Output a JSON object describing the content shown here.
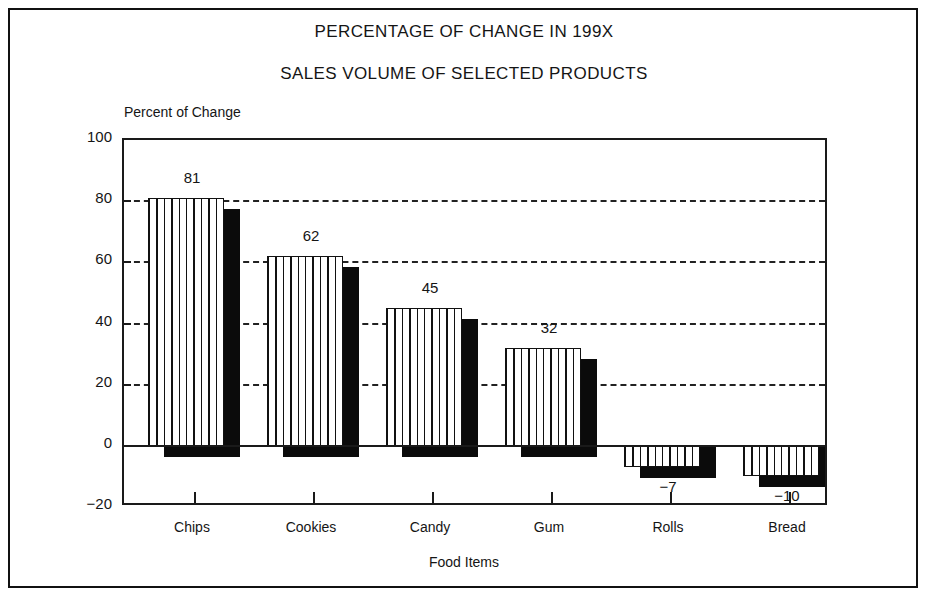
{
  "figure": {
    "title_main": "PERCENTAGE OF CHANGE IN 199X",
    "title_sub": "SALES VOLUME OF SELECTED PRODUCTS",
    "y_axis_caption": "Percent of Change",
    "x_axis_caption": "Food Items"
  },
  "chart_data": {
    "type": "bar",
    "title": "PERCENTAGE OF CHANGE IN 199X",
    "subtitle": "SALES VOLUME OF SELECTED PRODUCTS",
    "xlabel": "Food Items",
    "ylabel": "Percent of Change",
    "categories": [
      "Chips",
      "Cookies",
      "Candy",
      "Gum",
      "Rolls",
      "Bread"
    ],
    "values": [
      81,
      62,
      45,
      32,
      -7,
      -10
    ],
    "value_labels": [
      "81",
      "62",
      "45",
      "32",
      "−7",
      "−10"
    ],
    "ylim": [
      -20,
      100
    ],
    "yticks": [
      -20,
      0,
      20,
      40,
      60,
      80,
      100
    ],
    "ytick_labels": [
      "−20",
      "0",
      "20",
      "40",
      "60",
      "80",
      "100"
    ],
    "gridlines_at": [
      20,
      40,
      60,
      80
    ],
    "grid": "horizontal-dashed",
    "legend": "none",
    "style": "3d-shadow-hatched-bars",
    "bar_fill_color": "#ffffff",
    "bar_hatch_color": "#111111",
    "bar_shadow_color": "#0b0b0b",
    "axis_color": "#1a1a1a"
  }
}
